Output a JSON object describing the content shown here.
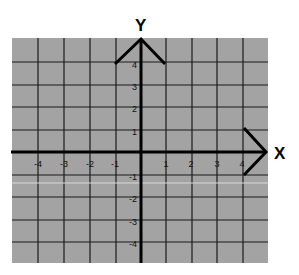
{
  "diagram": {
    "type": "coordinate-plane",
    "x_axis_label": "X",
    "y_axis_label": "Y",
    "x_range": [
      -5,
      5
    ],
    "y_range": [
      -5,
      5
    ],
    "x_ticks": [
      "-4",
      "-3",
      "-2",
      "-1",
      "1",
      "2",
      "3",
      "4"
    ],
    "y_ticks": [
      "4",
      "3",
      "2",
      "1",
      "-1",
      "-2",
      "-3",
      "-4"
    ],
    "colors": {
      "grid_fill": "#a3a3a3",
      "grid_lines": "#1a1a1a",
      "axes": "#000000",
      "background": "#ffffff"
    }
  }
}
